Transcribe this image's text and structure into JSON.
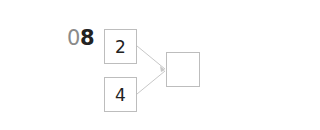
{
  "problem": {
    "number_prefix": "0",
    "number_main": "8"
  },
  "diagram": {
    "inputs": [
      {
        "value": "2"
      },
      {
        "value": "4"
      }
    ],
    "output": {
      "value": ""
    },
    "colors": {
      "box_border": "#bdbdbd",
      "arrow": "#c8c8c8",
      "text": "#222222",
      "label_prefix": "#8a8a8a"
    }
  }
}
